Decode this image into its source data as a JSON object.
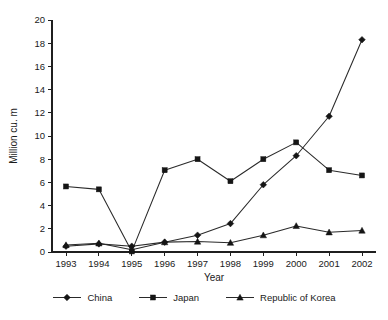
{
  "chart_data": {
    "type": "line",
    "title": "",
    "xlabel": "Year",
    "ylabel": "Million cu. m",
    "categories": [
      "1993",
      "1994",
      "1995",
      "1996",
      "1997",
      "1998",
      "1999",
      "2000",
      "2001",
      "2002"
    ],
    "x": [
      1993,
      1994,
      1995,
      1996,
      1997,
      1998,
      1999,
      2000,
      2001,
      2002
    ],
    "ylim": [
      0,
      20
    ],
    "ytick_step": 2,
    "yticks": [
      "0",
      "2",
      "4",
      "6",
      "8",
      "10",
      "12",
      "14",
      "16",
      "18",
      "20"
    ],
    "grid": false,
    "legend_position": "bottom",
    "series": [
      {
        "name": "China",
        "marker": "diamond",
        "color": "#151515",
        "values": [
          0.5,
          0.7,
          0.5,
          0.85,
          1.45,
          2.45,
          5.8,
          8.3,
          11.7,
          18.3
        ]
      },
      {
        "name": "Japan",
        "marker": "square",
        "color": "#151515",
        "values": [
          5.65,
          5.4,
          0.05,
          7.05,
          8.0,
          6.1,
          8.0,
          9.45,
          7.05,
          6.6
        ]
      },
      {
        "name": "Republic of Korea",
        "marker": "triangle",
        "color": "#151515",
        "values": [
          0.6,
          0.75,
          0.2,
          0.85,
          0.9,
          0.8,
          1.45,
          2.25,
          1.7,
          1.85
        ]
      }
    ],
    "japan_note_1995_low": 0.05
  },
  "legend": {
    "items": [
      {
        "label": "China",
        "marker": "diamond"
      },
      {
        "label": "Japan",
        "marker": "square"
      },
      {
        "label": "Republic of Korea",
        "marker": "triangle"
      }
    ]
  },
  "axes": {
    "y_title": "Million cu. m",
    "x_title": "Year"
  }
}
